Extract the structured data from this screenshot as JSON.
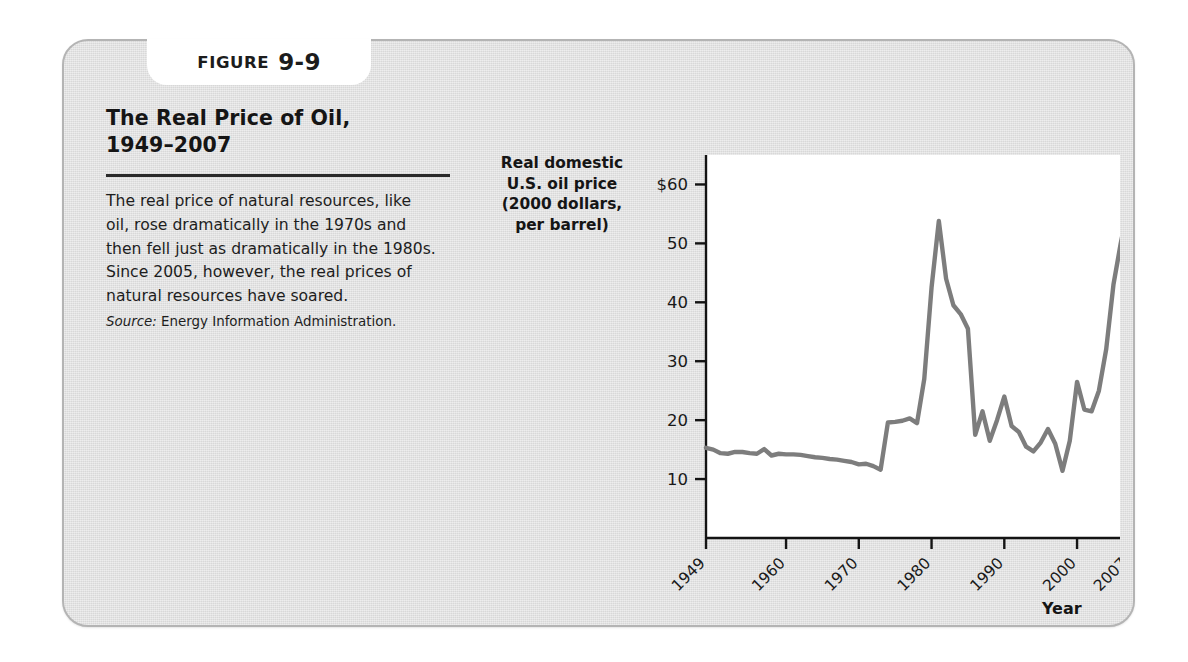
{
  "figure": {
    "banner_word": "FIGURE",
    "banner_number": "9-9",
    "title": "The Real Price of Oil,\n1949–2007",
    "body": "The real price of natural resources, like oil, rose dramatically in the 1970s and then fell just as dramatically in the 1980s. Since 2005, however, the real prices of natural resources have soared.",
    "source_label": "Source:",
    "source_text": " Energy Information Administration."
  },
  "colors": {
    "card_background": "#dedede",
    "card_border": "#b4b4b4",
    "plot_background": "#ffffff",
    "axis": "#141414",
    "line": "#7d7d7d",
    "text": "#181818"
  },
  "chart_data": {
    "type": "line",
    "title": "The Real Price of Oil, 1949–2007",
    "xlabel": "Year",
    "ylabel": "Real domestic U.S. oil price (2000 dollars, per barrel)",
    "ylabel_lines": "Real domestic\nU.S. oil price\n(2000 dollars,\nper barrel)",
    "xlim": [
      1949,
      2007
    ],
    "ylim": [
      0,
      65
    ],
    "grid": false,
    "legend": false,
    "ytick_values": [
      60,
      50,
      40,
      30,
      20,
      10
    ],
    "ytick_labels": [
      "$60",
      "50",
      "40",
      "30",
      "20",
      "10"
    ],
    "xtick_values": [
      1949,
      1960,
      1970,
      1980,
      1990,
      2000,
      2007
    ],
    "xtick_labels": [
      "1949",
      "1960",
      "1970",
      "1980",
      "1990",
      "2000",
      "2007"
    ],
    "series": [
      {
        "name": "Real domestic U.S. oil price",
        "x": [
          1949,
          1950,
          1951,
          1952,
          1953,
          1954,
          1955,
          1956,
          1957,
          1958,
          1959,
          1960,
          1961,
          1962,
          1963,
          1964,
          1965,
          1966,
          1967,
          1968,
          1969,
          1970,
          1971,
          1972,
          1973,
          1974,
          1975,
          1976,
          1977,
          1978,
          1979,
          1980,
          1981,
          1982,
          1983,
          1984,
          1985,
          1986,
          1987,
          1988,
          1989,
          1990,
          1991,
          1992,
          1993,
          1994,
          1995,
          1996,
          1997,
          1998,
          1999,
          2000,
          2001,
          2002,
          2003,
          2004,
          2005,
          2006,
          2007
        ],
        "values": [
          15.3,
          15.0,
          14.4,
          14.3,
          14.6,
          14.6,
          14.4,
          14.3,
          15.1,
          14.0,
          14.3,
          14.2,
          14.2,
          14.1,
          13.9,
          13.7,
          13.6,
          13.4,
          13.3,
          13.1,
          12.9,
          12.5,
          12.6,
          12.2,
          11.6,
          19.6,
          19.7,
          19.9,
          20.3,
          19.5,
          27.0,
          42.5,
          53.8,
          44.0,
          39.5,
          38.0,
          35.5,
          17.5,
          21.5,
          16.5,
          20.0,
          24.0,
          19.0,
          18.0,
          15.5,
          14.7,
          16.2,
          18.5,
          16.0,
          11.4,
          16.5,
          26.5,
          21.8,
          21.5,
          25.0,
          32.0,
          43.0,
          50.0,
          56.0
        ]
      }
    ],
    "annotations": []
  }
}
